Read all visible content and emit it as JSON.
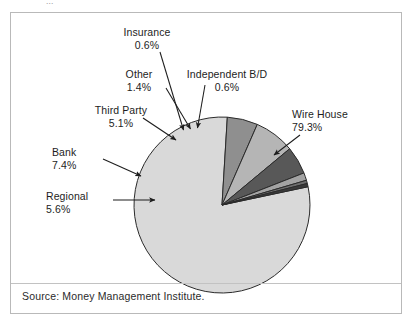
{
  "caption": "...",
  "source_note": "Source: Money Management Institute.",
  "chart_data": {
    "type": "pie",
    "title": "",
    "legend_position": "callout-labels",
    "grid": false,
    "categories": [
      "Wire House",
      "Regional",
      "Bank",
      "Third Party",
      "Other",
      "Insurance",
      "Independent B/D"
    ],
    "values": [
      79.3,
      5.6,
      7.4,
      5.1,
      1.4,
      0.6,
      0.6
    ],
    "value_labels": [
      "79.3%",
      "5.6%",
      "7.4%",
      "5.1%",
      "1.4%",
      "0.6%",
      "0.6%"
    ],
    "units": "percent",
    "slices": [
      {
        "name": "Wire House",
        "value": 79.3,
        "label": "Wire House",
        "pct": "79.3%",
        "color": "#d9d9d9"
      },
      {
        "name": "Regional",
        "value": 5.6,
        "label": "Regional",
        "pct": "5.6%",
        "color": "#8f8f8f"
      },
      {
        "name": "Bank",
        "value": 7.4,
        "label": "Bank",
        "pct": "7.4%",
        "color": "#b5b5b5"
      },
      {
        "name": "Third Party",
        "value": 5.1,
        "label": "Third Party",
        "pct": "5.1%",
        "color": "#585858"
      },
      {
        "name": "Other",
        "value": 1.4,
        "label": "Other",
        "pct": "1.4%",
        "color": "#a3a3a3"
      },
      {
        "name": "Insurance",
        "value": 0.6,
        "label": "Insurance",
        "pct": "0.6%",
        "color": "#6e6e6e"
      },
      {
        "name": "Independent B/D",
        "value": 0.6,
        "label": "Independent B/D",
        "pct": "0.6%",
        "color": "#3a3a3a"
      }
    ]
  },
  "labels": {
    "insurance": {
      "name": "Insurance",
      "pct": "0.6%"
    },
    "other": {
      "name": "Other",
      "pct": "1.4%"
    },
    "independent": {
      "name": "Independent B/D",
      "pct": "0.6%"
    },
    "third_party": {
      "name": "Third Party",
      "pct": "5.1%"
    },
    "bank": {
      "name": "Bank",
      "pct": "7.4%"
    },
    "regional": {
      "name": "Regional",
      "pct": "5.6%"
    },
    "wire_house": {
      "name": "Wire House",
      "pct": "79.3%"
    }
  },
  "colors": {
    "frame_border": "#b9b9b9",
    "pie_outline": "#2b2b2b",
    "text": "#1d1d1d",
    "background": "#ffffff"
  }
}
